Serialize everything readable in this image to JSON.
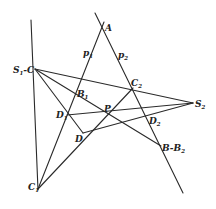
{
  "diagram": {
    "type": "geometric-construction",
    "stroke_color": "#2a2a2a",
    "points": {
      "A": {
        "label": "A",
        "x": 102,
        "y": 27
      },
      "S1C": {
        "label": "S",
        "sub": "1",
        "suffix": "C",
        "x": 35,
        "y": 69
      },
      "C2": {
        "label": "C",
        "sub": "2",
        "x": 133,
        "y": 88
      },
      "S2": {
        "label": "S",
        "sub": "2",
        "x": 193,
        "y": 103
      },
      "B1": {
        "label": "B",
        "sub": "1",
        "x": 80,
        "y": 93
      },
      "P": {
        "label": "P",
        "x": 108,
        "y": 114
      },
      "D1": {
        "label": "D",
        "sub": "1",
        "x": 67,
        "y": 115
      },
      "D2": {
        "label": "D",
        "sub": "2",
        "x": 147,
        "y": 117
      },
      "D": {
        "label": "D",
        "x": 83,
        "y": 133
      },
      "B": {
        "label": "B-B",
        "sub": "2",
        "x": 161,
        "y": 146
      },
      "C1": {
        "label": "C",
        "sub": "1",
        "x": 38,
        "y": 188
      }
    },
    "line_labels": {
      "p1": {
        "label": "p",
        "sub": "1",
        "x": 84,
        "y": 55
      },
      "p2": {
        "label": "p",
        "sub": "2",
        "x": 118,
        "y": 57
      }
    }
  }
}
